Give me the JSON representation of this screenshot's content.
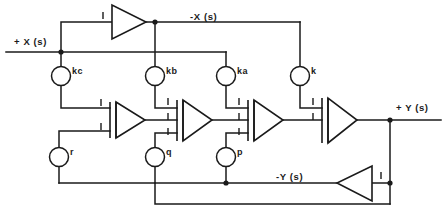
{
  "diagram": {
    "signals": {
      "input_x": "+ X (s)",
      "inverted_x": "-X (s)",
      "output_y": "+ Y (s)",
      "inverted_y": "-Y (s)"
    },
    "gain_nodes": [
      {
        "id": "kc",
        "label": "kc",
        "cx": 61,
        "cy": 76,
        "r": 9.5
      },
      {
        "id": "kb",
        "label": "kb",
        "cx": 155,
        "cy": 76,
        "r": 9.5
      },
      {
        "id": "ka",
        "label": "ka",
        "cx": 226,
        "cy": 76,
        "r": 9.5
      },
      {
        "id": "k",
        "label": "k",
        "cx": 300,
        "cy": 76,
        "r": 9.5
      },
      {
        "id": "r",
        "label": "r",
        "cx": 59,
        "cy": 157,
        "r": 9.5
      },
      {
        "id": "q",
        "label": "q",
        "cx": 155,
        "cy": 157,
        "r": 9.5
      },
      {
        "id": "p",
        "label": "p",
        "cx": 226,
        "cy": 157,
        "r": 9.5
      }
    ],
    "amplifiers": [
      {
        "id": "inverter-top",
        "gain": "1",
        "orientation": "right",
        "inputs": 1
      },
      {
        "id": "integrator-1",
        "gain": "1",
        "orientation": "right",
        "inputs": 2
      },
      {
        "id": "integrator-2",
        "gain": "1",
        "orientation": "right",
        "inputs": 3
      },
      {
        "id": "integrator-3",
        "gain": "1",
        "orientation": "right",
        "inputs": 3
      },
      {
        "id": "summer-output",
        "gain": "1",
        "orientation": "right",
        "inputs": 2
      },
      {
        "id": "inverter-bottom",
        "gain": "1",
        "orientation": "left",
        "inputs": 1
      }
    ],
    "gain_labels": {
      "unity": "1"
    }
  }
}
